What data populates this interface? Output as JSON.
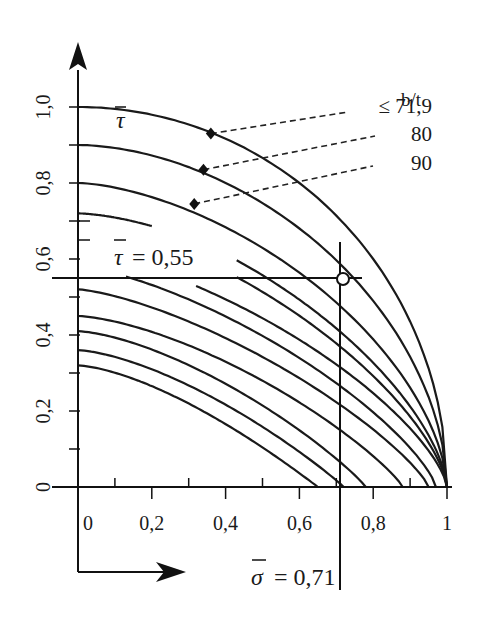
{
  "chart_data": {
    "type": "line",
    "title": "",
    "xlabel": "σ̄",
    "ylabel": "τ̄",
    "xlim": [
      0,
      1
    ],
    "ylim": [
      0,
      1.0
    ],
    "grid": false,
    "x_ticks": [
      "0",
      "0,2",
      "0,4",
      "0,6",
      "0,8",
      "1"
    ],
    "x_tick_values": [
      0,
      0.2,
      0.4,
      0.6,
      0.8,
      1.0
    ],
    "y_ticks": [
      "0",
      "0,2",
      "0,4",
      "0,6",
      "0,8",
      "1,0"
    ],
    "y_tick_values": [
      0,
      0.2,
      0.4,
      0.6,
      0.8,
      1.0
    ],
    "legend": {
      "title": "b/t",
      "entries": [
        "≤ 71,9",
        "80",
        "90"
      ]
    },
    "series": [
      {
        "name": "b/t ≤ 71,9",
        "tau0": 1.0,
        "sigma_start": 0.0,
        "sigma_end": 1.0,
        "p": 2.0,
        "q": 0.5
      },
      {
        "name": "b/t = 80",
        "tau0": 0.9,
        "sigma_start": 0.0,
        "sigma_end": 1.0,
        "p": 1.8,
        "q": 0.55
      },
      {
        "name": "b/t = 90",
        "tau0": 0.8,
        "sigma_start": 0.0,
        "sigma_end": 1.0,
        "p": 1.6,
        "q": 0.6
      },
      {
        "name": "curve-4",
        "tau0": 0.72,
        "sigma_start": 0.0,
        "sigma_end": 0.2,
        "p": 1.6,
        "q": 0.6,
        "full_end": 1.0
      },
      {
        "name": "curve-5",
        "tau0": 0.74,
        "sigma_start": 0.43,
        "sigma_end": 1.0,
        "p": 1.5,
        "q": 0.65
      },
      {
        "name": "curve-6",
        "tau0": 0.7,
        "sigma_start": 0.43,
        "sigma_end": 1.0,
        "p": 1.45,
        "q": 0.68
      },
      {
        "name": "curve-7",
        "tau0": 0.62,
        "sigma_start": 0.32,
        "sigma_end": 1.0,
        "p": 1.4,
        "q": 0.7
      },
      {
        "name": "curve-8",
        "tau0": 0.58,
        "sigma_start": 0.13,
        "sigma_end": 0.97,
        "p": 1.4,
        "q": 0.75
      },
      {
        "name": "curve-9",
        "tau0": 0.52,
        "sigma_start": 0.0,
        "sigma_end": 0.95,
        "p": 1.4,
        "q": 0.8
      },
      {
        "name": "curve-10",
        "tau0": 0.45,
        "sigma_start": 0.0,
        "sigma_end": 0.88,
        "p": 1.5,
        "q": 0.85
      },
      {
        "name": "curve-11",
        "tau0": 0.41,
        "sigma_start": 0.0,
        "sigma_end": 0.78,
        "p": 1.5,
        "q": 0.9
      },
      {
        "name": "curve-12",
        "tau0": 0.36,
        "sigma_start": 0.0,
        "sigma_end": 0.72,
        "p": 1.5,
        "q": 0.95
      },
      {
        "name": "curve-13",
        "tau0": 0.32,
        "sigma_start": 0.0,
        "sigma_end": 0.65,
        "p": 1.5,
        "q": 1.0
      }
    ],
    "markers": [
      {
        "label": "≤ 71,9",
        "sigma": 0.36,
        "tau": 0.93
      },
      {
        "label": "80",
        "sigma": 0.34,
        "tau": 0.835
      },
      {
        "label": "90",
        "sigma": 0.315,
        "tau": 0.745
      }
    ],
    "annotations": {
      "tau_line": {
        "label": "τ̄ = 0,55",
        "value": 0.55
      },
      "sigma_line": {
        "label": "σ̄ = 0,71",
        "value": 0.71
      },
      "operating_point": {
        "sigma": 0.71,
        "tau": 0.55
      }
    }
  },
  "labels": {
    "y_axis_symbol": "τ",
    "x_axis_symbol": "σ",
    "tau_eq": "= 0,55",
    "sigma_eq": "= 0,71",
    "legend_title": "b/t",
    "legend_1": "≤ 71,9",
    "legend_2": "80",
    "legend_3": "90"
  }
}
